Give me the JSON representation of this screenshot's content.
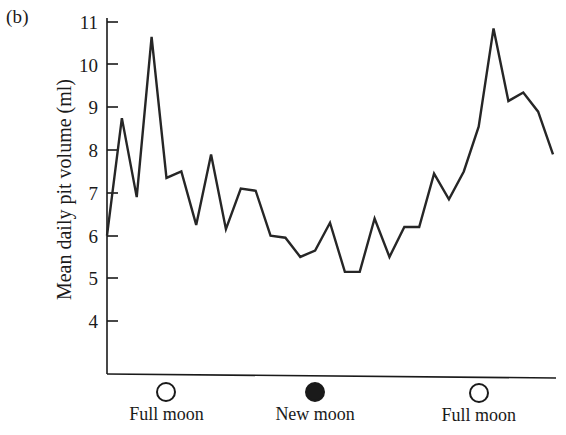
{
  "panel": {
    "label": "(b)"
  },
  "axes": {
    "ylabel": "Mean daily pit volume (ml)",
    "yticks": [
      "11",
      "10",
      "9",
      "8",
      "7",
      "6",
      "5",
      "4"
    ],
    "ytick_values": [
      11,
      10,
      9,
      8,
      7,
      6,
      5,
      4
    ],
    "ylim": [
      3.3,
      11.4
    ],
    "grid": false
  },
  "moon_markers": [
    {
      "name": "full-moon-left",
      "label": "Full moon",
      "phase": "full",
      "x_index": 4
    },
    {
      "name": "new-moon-center",
      "label": "New moon",
      "phase": "new",
      "x_index": 14
    },
    {
      "name": "full-moon-right",
      "label": "Full moon",
      "phase": "full",
      "x_index": 25
    }
  ],
  "colors": {
    "line": "#262626",
    "axis": "#1a1a1a",
    "background": "#ffffff",
    "moon_full": "#ffffff",
    "moon_new": "#1a1a1a"
  },
  "chart_data": {
    "type": "line",
    "title": "",
    "xlabel": "",
    "ylabel": "Mean daily pit volume (ml)",
    "ylim": [
      3.3,
      11.4
    ],
    "grid": false,
    "legend": "none",
    "x": [
      0,
      1,
      2,
      3,
      4,
      5,
      6,
      7,
      8,
      9,
      10,
      11,
      12,
      13,
      14,
      15,
      16,
      17,
      18,
      19,
      20,
      21,
      22,
      23,
      24,
      25,
      26,
      27,
      28,
      29,
      30
    ],
    "values": [
      6.0,
      8.75,
      6.9,
      10.65,
      7.35,
      7.5,
      6.25,
      7.9,
      6.15,
      7.1,
      7.05,
      6.0,
      5.95,
      5.5,
      5.65,
      6.3,
      5.15,
      5.15,
      6.4,
      5.5,
      6.2,
      6.2,
      7.45,
      6.85,
      7.5,
      8.55,
      10.85,
      9.15,
      9.35,
      8.9,
      7.9
    ],
    "series": [
      {
        "name": "Mean daily pit volume",
        "values": [
          6.0,
          8.75,
          6.9,
          10.65,
          7.35,
          7.5,
          6.25,
          7.9,
          6.15,
          7.1,
          7.05,
          6.0,
          5.95,
          5.5,
          5.65,
          6.3,
          5.15,
          5.15,
          6.4,
          5.5,
          6.2,
          6.2,
          7.45,
          6.85,
          7.5,
          8.55,
          10.85,
          9.15,
          9.35,
          8.9,
          7.9
        ]
      }
    ],
    "annotations": [
      {
        "text": "Full moon",
        "x_index": 4
      },
      {
        "text": "New moon",
        "x_index": 14
      },
      {
        "text": "Full moon",
        "x_index": 25
      }
    ]
  }
}
